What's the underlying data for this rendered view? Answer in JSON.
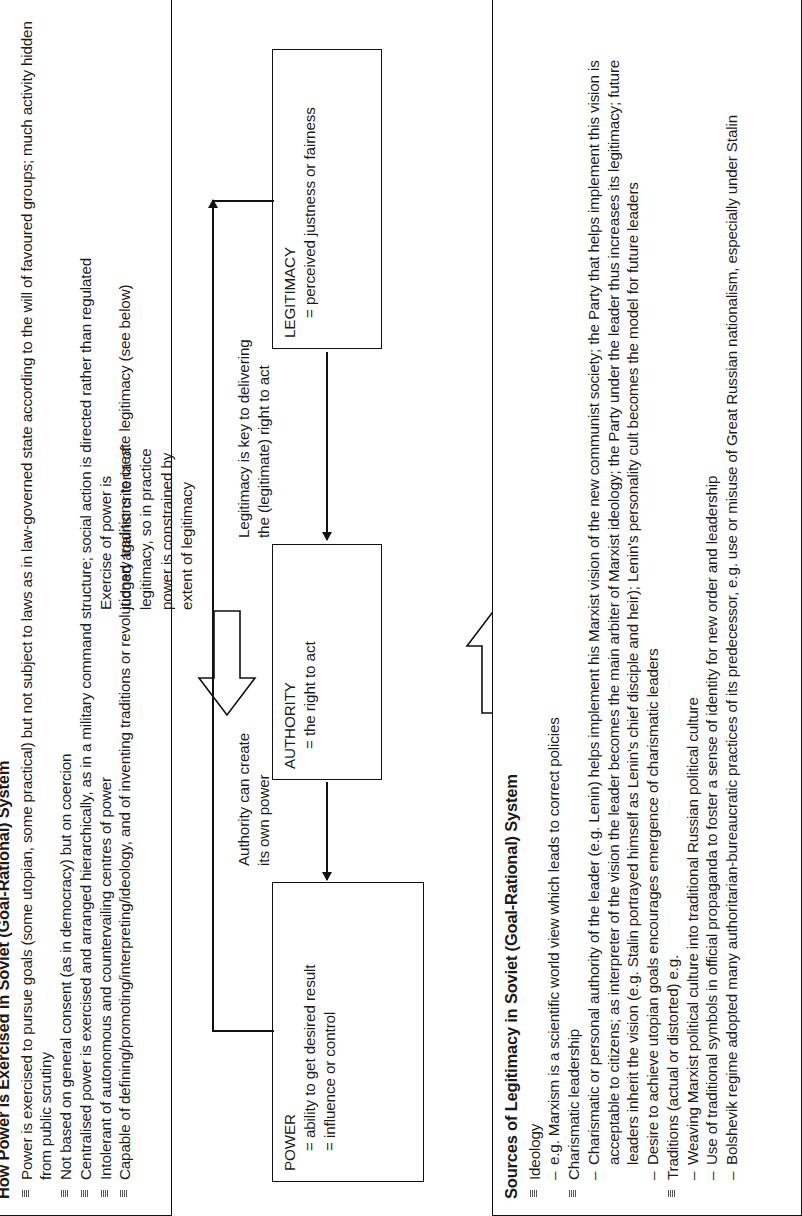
{
  "document": {
    "orientation": "rotated-90-ccw",
    "page_background": "#ffffff",
    "ink_color": "#111111"
  },
  "panel_top": {
    "title": "How Power is Exercised in Soviet (Goal-Rational) System",
    "bullets": [
      "Power is exercised to pursue goals (some utopian, some practical) but not subject to laws as in law-governed state according to the will of favoured groups; much activity hidden from public scrutiny",
      "Not based on general consent (as in democracy) but on coercion",
      "Centralised power is exercised and arranged hierarchically, as in a military command structure; social action is directed rather than regulated",
      "Intolerant of autonomous and countervailing centres of power",
      "Capable of defining/promoting/interpreting/ideology, and of inventing traditions or revolutionary traditions to create legitimacy (see below)"
    ]
  },
  "diagram": {
    "power_box": {
      "title": "POWER",
      "line1": "= ability to get desired result",
      "line2": "= influence or control"
    },
    "authority_box": {
      "title": "AUTHORITY",
      "line1": "= the right to act"
    },
    "legitimacy_box": {
      "title": "LEGITIMACY",
      "line1": "= perceived justness or fairness"
    },
    "note_authority": "Authority can create\nits own power",
    "note_exercise": "Exercise of power is\njudged against criteria of\nlegitimacy, so in practice\npower is constrained by\nextent of legitimacy",
    "note_legitimacy": "Legitimacy is key to delivering\nthe (legitimate) right to act",
    "note_authority_l1": "Authority can create",
    "note_authority_l2": "its own power",
    "note_exercise_l1": "Exercise of power is",
    "note_exercise_l2": "judged against criteria of",
    "note_exercise_l3": "legitimacy, so in practice",
    "note_exercise_l4": "power is constrained by",
    "note_exercise_l5": "extent of legitimacy",
    "note_legitimacy_l1": "Legitimacy is key to delivering",
    "note_legitimacy_l2": "the (legitimate) right to act"
  },
  "panel_bottom": {
    "title": "Sources of Legitimacy in Soviet (Goal-Rational) System",
    "items": [
      {
        "bullet": "Ideology",
        "subs": [
          "e.g. Marxism is a scientific world view which leads to correct policies"
        ]
      },
      {
        "bullet": "Charismatic leadership",
        "subs": [
          "Charismatic or personal authority of the leader (e.g. Lenin) helps implement his Marxist vision of the new communist society; the Party that helps implement this vision is acceptable to citizens; as interpreter of the vision the leader becomes the main arbiter of Marxist ideology; the Party under the leader thus increases its legitimacy; future leaders inherit the vision (e.g. Stalin portrayed himself as Lenin's chief disciple and heir); Lenin's personality cult becomes the model for future leaders",
          "Desire to achieve utopian goals encourages emergence of charismatic leaders"
        ]
      },
      {
        "bullet": "Traditions (actual or distorted) e.g.",
        "subs": [
          "Weaving Marxist political culture into traditional Russian political culture",
          "Use of traditional symbols in official propaganda to foster a sense of identity for new order and leadership",
          "Bolshevik regime adopted many authoritarian-bureaucratic practices of its predecessor, e.g. use or misuse of Great Russian nationalism, especially under Stalin"
        ]
      }
    ]
  }
}
